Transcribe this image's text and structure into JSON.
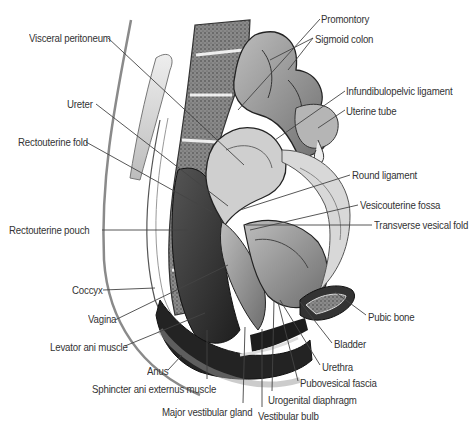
{
  "figure": {
    "labels": [
      {
        "id": "promontory",
        "text": "Promontory",
        "x": 321,
        "y": 13
      },
      {
        "id": "visceral-peritoneum",
        "text": "Visceral peritoneum",
        "x": 29,
        "y": 32
      },
      {
        "id": "sigmoid-colon",
        "text": "Sigmoid colon",
        "x": 315,
        "y": 33
      },
      {
        "id": "infundibulopelvic-ligament",
        "text": "Infundibulopelvic ligament",
        "x": 346,
        "y": 85
      },
      {
        "id": "ureter",
        "text": "Ureter",
        "x": 67,
        "y": 98
      },
      {
        "id": "uterine-tube",
        "text": "Uterine tube",
        "x": 346,
        "y": 105
      },
      {
        "id": "rectouterine-fold",
        "text": "Rectouterine fold",
        "x": 18,
        "y": 136
      },
      {
        "id": "round-ligament",
        "text": "Round ligament",
        "x": 352,
        "y": 169
      },
      {
        "id": "vesicouterine-fossa",
        "text": "Vesicouterine fossa",
        "x": 360,
        "y": 199
      },
      {
        "id": "rectouterine-pouch",
        "text": "Rectouterine pouch",
        "x": 9,
        "y": 224
      },
      {
        "id": "transverse-vesical-fold",
        "text": "Transverse vesical fold",
        "x": 374,
        "y": 219
      },
      {
        "id": "coccyx",
        "text": "Coccyx",
        "x": 72,
        "y": 284
      },
      {
        "id": "pubic-bone",
        "text": "Pubic bone",
        "x": 368,
        "y": 311
      },
      {
        "id": "vagina",
        "text": "Vagina",
        "x": 88,
        "y": 313
      },
      {
        "id": "levator-ani-muscle",
        "text": "Levator ani muscle",
        "x": 50,
        "y": 341
      },
      {
        "id": "bladder",
        "text": "Bladder",
        "x": 334,
        "y": 338
      },
      {
        "id": "urethra",
        "text": "Urethra",
        "x": 322,
        "y": 361
      },
      {
        "id": "pubovesical-fascia",
        "text": "Pubovesical fascia",
        "x": 300,
        "y": 377
      },
      {
        "id": "anus",
        "text": "Anus",
        "x": 147,
        "y": 365
      },
      {
        "id": "sphincter-ani-externus-muscle",
        "text": "Sphincter ani externus muscle",
        "x": 92,
        "y": 383
      },
      {
        "id": "urogenital-diaphragm",
        "text": "Urogenital diaphragm",
        "x": 268,
        "y": 394
      },
      {
        "id": "major-vestibular-gland",
        "text": "Major vestibular gland",
        "x": 162,
        "y": 406
      },
      {
        "id": "vestibular-bulb",
        "text": "Vestibular bulb",
        "x": 258,
        "y": 410
      }
    ],
    "colors": {
      "label_text": "#333333",
      "leader_line": "#444444",
      "tissue_dark": "#2a2a2a",
      "tissue_mid": "#7a7a7a",
      "tissue_light": "#c8c8c8",
      "bone_fill": "#9a9a9a",
      "background": "#ffffff"
    }
  }
}
